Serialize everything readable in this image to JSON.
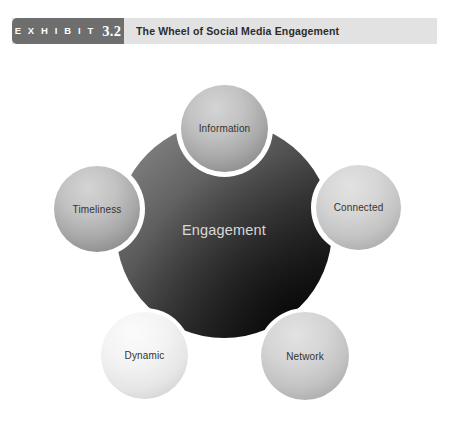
{
  "exhibit": {
    "label": "E X H I B I T",
    "number": "3.2",
    "title": "The Wheel of Social Media Engagement"
  },
  "diagram": {
    "type": "hub-and-spoke-wheel",
    "hub": {
      "label": "Engagement"
    },
    "nodes": [
      {
        "label": "Information",
        "position": "top"
      },
      {
        "label": "Connected",
        "position": "right"
      },
      {
        "label": "Timeliness",
        "position": "left"
      },
      {
        "label": "Dynamic",
        "position": "bottom-left"
      },
      {
        "label": "Network",
        "position": "bottom-right"
      }
    ]
  },
  "colors": {
    "header_bar": "#e2e2e2",
    "badge": "#6e6e6e",
    "badge_text": "#ffffff",
    "title_text": "#2c2c2c",
    "hub_light": "#8d8d8d",
    "hub_dark": "#070707",
    "hub_label_text": "#d8d8d8",
    "node_ring": "#ffffff",
    "node_label_text": "#34332f",
    "page_background": "#ffffff"
  }
}
